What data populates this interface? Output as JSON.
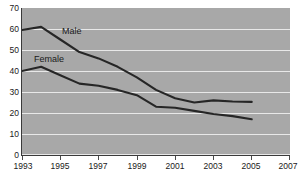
{
  "chart_data": {
    "type": "line",
    "title": "",
    "xlabel": "",
    "ylabel": "",
    "ylim": [
      0,
      70
    ],
    "xlim": [
      1993,
      2007
    ],
    "grid": true,
    "legend_position": "inline-annotation",
    "y_ticks": [
      70,
      60,
      50,
      40,
      30,
      20,
      10,
      0
    ],
    "x_ticks": [
      1993,
      1995,
      1997,
      1999,
      2001,
      2003,
      2005,
      2007
    ],
    "x": [
      1993,
      1994,
      1995,
      1996,
      1997,
      1998,
      1999,
      2000,
      2001,
      2002,
      2003,
      2004,
      2005
    ],
    "series": [
      {
        "name": "Male",
        "color": "#262626",
        "values": [
          59.5,
          61,
          55,
          49,
          46,
          42,
          37,
          31,
          27,
          25,
          26,
          25.5,
          25.3
        ]
      },
      {
        "name": "Female",
        "color": "#262626",
        "values": [
          40,
          42,
          38,
          34,
          33,
          31,
          28.5,
          23,
          22.5,
          21,
          19.5,
          18.5,
          17
        ]
      }
    ],
    "annotations": [
      {
        "text": "Male",
        "x": 1996,
        "y": 53
      },
      {
        "text": "Female",
        "x": 1994.3,
        "y": 45
      }
    ]
  },
  "axis": {
    "y_labels": [
      "70",
      "60",
      "50",
      "40",
      "30",
      "20",
      "10",
      "0"
    ],
    "x_labels": [
      "1993",
      "1995",
      "1997",
      "1999",
      "2001",
      "2003",
      "2005",
      "2007"
    ]
  },
  "colors": {
    "plot_background": "#a8a8a8",
    "gridline": "#e8e8e8",
    "axis": "#3a3a3a",
    "series": "#262626",
    "page_background": "#ffffff"
  }
}
